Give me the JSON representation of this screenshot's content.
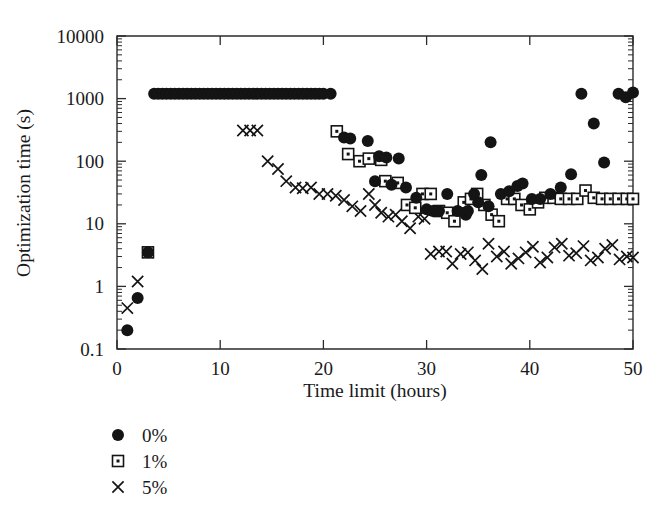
{
  "chart_data": {
    "type": "scatter",
    "title": "",
    "xlabel": "Time limit (hours)",
    "ylabel": "Optimization time (s)",
    "xlim": [
      0,
      50
    ],
    "ylim": [
      0.1,
      10000
    ],
    "yscale": "log",
    "xscale": "linear",
    "grid": false,
    "xticks": [
      0,
      10,
      20,
      30,
      40,
      50
    ],
    "xticklabels": [
      "0",
      "10",
      "20",
      "30",
      "40",
      "50"
    ],
    "yticks": [
      0.1,
      1,
      10,
      100,
      1000,
      10000
    ],
    "yticklabels": [
      "0.1",
      "1",
      "10",
      "100",
      "1000",
      "10000"
    ],
    "legend_position": "below-left",
    "legend": [
      {
        "label": "0%",
        "marker": "filled-circle"
      },
      {
        "label": "1%",
        "marker": "open-square-dot"
      },
      {
        "label": "5%",
        "marker": "cross"
      }
    ],
    "series": [
      {
        "name": "0%",
        "marker": "filled-circle",
        "points": [
          [
            1.0,
            0.2
          ],
          [
            2.0,
            0.65
          ],
          [
            3.0,
            3.5
          ],
          [
            3.6,
            1200
          ],
          [
            4.0,
            1200
          ],
          [
            4.4,
            1200
          ],
          [
            4.8,
            1200
          ],
          [
            5.2,
            1200
          ],
          [
            5.6,
            1200
          ],
          [
            6.0,
            1200
          ],
          [
            6.4,
            1200
          ],
          [
            6.8,
            1200
          ],
          [
            7.2,
            1200
          ],
          [
            7.6,
            1200
          ],
          [
            8.0,
            1200
          ],
          [
            8.4,
            1200
          ],
          [
            8.8,
            1200
          ],
          [
            9.2,
            1200
          ],
          [
            9.6,
            1200
          ],
          [
            10.0,
            1200
          ],
          [
            10.4,
            1200
          ],
          [
            10.8,
            1200
          ],
          [
            11.2,
            1200
          ],
          [
            11.6,
            1200
          ],
          [
            12.0,
            1200
          ],
          [
            12.4,
            1200
          ],
          [
            12.8,
            1200
          ],
          [
            13.2,
            1200
          ],
          [
            13.6,
            1200
          ],
          [
            14.0,
            1200
          ],
          [
            14.4,
            1200
          ],
          [
            14.8,
            1200
          ],
          [
            15.2,
            1200
          ],
          [
            15.6,
            1200
          ],
          [
            16.0,
            1200
          ],
          [
            16.4,
            1200
          ],
          [
            16.8,
            1200
          ],
          [
            17.2,
            1200
          ],
          [
            17.6,
            1200
          ],
          [
            18.0,
            1200
          ],
          [
            18.4,
            1200
          ],
          [
            18.8,
            1200
          ],
          [
            19.2,
            1200
          ],
          [
            19.6,
            1200
          ],
          [
            20.0,
            1200
          ],
          [
            20.7,
            1200
          ],
          [
            22.0,
            240
          ],
          [
            22.6,
            230
          ],
          [
            24.3,
            210
          ],
          [
            25.4,
            120
          ],
          [
            26.1,
            115
          ],
          [
            27.3,
            110
          ],
          [
            25.0,
            48
          ],
          [
            26.6,
            42
          ],
          [
            28.0,
            38
          ],
          [
            29.0,
            26
          ],
          [
            30.0,
            17
          ],
          [
            30.6,
            16
          ],
          [
            31.2,
            16
          ],
          [
            32.0,
            30
          ],
          [
            33.0,
            16
          ],
          [
            33.8,
            14
          ],
          [
            34.6,
            30
          ],
          [
            35.3,
            60
          ],
          [
            36.2,
            200
          ],
          [
            34.0,
            16
          ],
          [
            35.0,
            22
          ],
          [
            36.0,
            19
          ],
          [
            37.2,
            30
          ],
          [
            38.0,
            33
          ],
          [
            38.8,
            40
          ],
          [
            39.3,
            44
          ],
          [
            40.2,
            25
          ],
          [
            41.0,
            25
          ],
          [
            42.0,
            30
          ],
          [
            43.0,
            38
          ],
          [
            44.0,
            62
          ],
          [
            45.0,
            1200
          ],
          [
            46.2,
            400
          ],
          [
            47.2,
            95
          ],
          [
            48.6,
            1200
          ],
          [
            49.3,
            1050
          ],
          [
            50.0,
            1250
          ]
        ]
      },
      {
        "name": "1%",
        "marker": "open-square-dot",
        "points": [
          [
            3.0,
            3.5
          ],
          [
            21.3,
            300
          ],
          [
            22.4,
            130
          ],
          [
            23.5,
            100
          ],
          [
            24.4,
            110
          ],
          [
            25.6,
            105
          ],
          [
            26.0,
            48
          ],
          [
            27.2,
            45
          ],
          [
            28.1,
            20
          ],
          [
            28.9,
            18
          ],
          [
            29.6,
            30
          ],
          [
            30.4,
            30
          ],
          [
            31.2,
            16
          ],
          [
            32.0,
            15
          ],
          [
            32.7,
            11
          ],
          [
            33.6,
            22
          ],
          [
            34.3,
            25
          ],
          [
            34.9,
            30
          ],
          [
            35.6,
            20
          ],
          [
            36.3,
            14
          ],
          [
            37.0,
            11
          ],
          [
            37.8,
            25
          ],
          [
            38.5,
            25
          ],
          [
            39.2,
            20
          ],
          [
            40.0,
            17
          ],
          [
            40.8,
            22
          ],
          [
            41.5,
            26
          ],
          [
            42.3,
            26
          ],
          [
            43.0,
            25
          ],
          [
            43.8,
            25
          ],
          [
            44.6,
            25
          ],
          [
            45.4,
            34
          ],
          [
            46.2,
            26
          ],
          [
            47.0,
            25
          ],
          [
            47.8,
            25
          ],
          [
            48.6,
            25
          ],
          [
            49.4,
            25
          ],
          [
            50.0,
            25
          ]
        ]
      },
      {
        "name": "5%",
        "marker": "cross",
        "points": [
          [
            1.0,
            0.45
          ],
          [
            2.0,
            1.2
          ],
          [
            3.0,
            3.5
          ],
          [
            12.2,
            310
          ],
          [
            12.9,
            310
          ],
          [
            13.6,
            310
          ],
          [
            14.6,
            100
          ],
          [
            15.6,
            75
          ],
          [
            16.4,
            48
          ],
          [
            17.3,
            38
          ],
          [
            18.0,
            37
          ],
          [
            18.8,
            38
          ],
          [
            19.6,
            30
          ],
          [
            20.4,
            30
          ],
          [
            21.2,
            28
          ],
          [
            22.0,
            24
          ],
          [
            22.8,
            19
          ],
          [
            23.6,
            16
          ],
          [
            24.4,
            30
          ],
          [
            25.0,
            20
          ],
          [
            25.6,
            15
          ],
          [
            26.3,
            13
          ],
          [
            27.0,
            14
          ],
          [
            27.6,
            11
          ],
          [
            28.4,
            8.5
          ],
          [
            29.2,
            13
          ],
          [
            29.8,
            12
          ],
          [
            30.4,
            3.3
          ],
          [
            31.2,
            3.6
          ],
          [
            31.9,
            3.6
          ],
          [
            32.5,
            2.3
          ],
          [
            33.3,
            3.3
          ],
          [
            34.0,
            3.5
          ],
          [
            34.7,
            2.6
          ],
          [
            35.4,
            1.9
          ],
          [
            36.0,
            4.8
          ],
          [
            36.8,
            3.0
          ],
          [
            37.5,
            3.6
          ],
          [
            38.2,
            2.3
          ],
          [
            38.9,
            2.8
          ],
          [
            39.6,
            3.5
          ],
          [
            40.3,
            4.3
          ],
          [
            41.0,
            2.4
          ],
          [
            41.7,
            2.9
          ],
          [
            42.4,
            4.2
          ],
          [
            43.1,
            4.8
          ],
          [
            43.8,
            3.1
          ],
          [
            44.5,
            3.4
          ],
          [
            45.2,
            4.4
          ],
          [
            45.9,
            2.6
          ],
          [
            46.6,
            2.9
          ],
          [
            47.3,
            4.0
          ],
          [
            48.0,
            4.6
          ],
          [
            48.7,
            2.7
          ],
          [
            49.4,
            3.0
          ],
          [
            50.0,
            2.9
          ]
        ]
      }
    ]
  }
}
